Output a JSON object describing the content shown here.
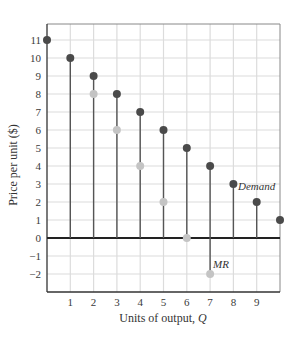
{
  "chart_data": {
    "type": "scatter",
    "style": "stem",
    "title": "",
    "xlabel": "Units of output, Q",
    "ylabel": "Price per unit ($)",
    "xlim": [
      0,
      10
    ],
    "ylim": [
      -3,
      12
    ],
    "x_ticks": [
      1,
      2,
      3,
      4,
      5,
      6,
      7,
      8,
      9
    ],
    "y_ticks": [
      -2,
      -1,
      0,
      1,
      2,
      3,
      4,
      5,
      6,
      7,
      8,
      9,
      10,
      11
    ],
    "grid": true,
    "series": [
      {
        "name": "Demand",
        "color": "#4a4a4a",
        "x": [
          0,
          1,
          2,
          3,
          4,
          5,
          6,
          7,
          8,
          9,
          10
        ],
        "values": [
          11,
          10,
          9,
          8,
          7,
          6,
          5,
          4,
          3,
          2,
          1
        ]
      },
      {
        "name": "MR",
        "color": "#c4c4c4",
        "x": [
          2,
          3,
          4,
          5,
          6,
          7
        ],
        "values": [
          8,
          6,
          4,
          2,
          0,
          -2
        ]
      }
    ],
    "annotations": [
      {
        "text": "Demand",
        "x": 8,
        "y": 3
      },
      {
        "text": "MR",
        "x": 7,
        "y": -2
      }
    ]
  },
  "labels": {
    "xlabel_prefix": "Units of output, ",
    "xlabel_var": "Q",
    "ylabel": "Price per unit ($)",
    "demand": "Demand",
    "mr": "MR"
  }
}
